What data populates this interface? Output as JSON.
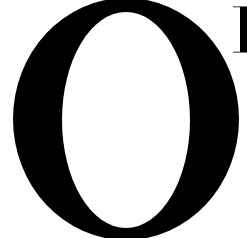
{
  "text": {
    "visible_glyphs": "O",
    "partial_next_glyph": "stem of a serif capital (cropped)"
  },
  "colors": {
    "ink": "#000000",
    "background": "#ffffff"
  },
  "glyph_o": {
    "outer": {
      "cx": 126,
      "cy": 119,
      "rx": 113,
      "ry": 121
    },
    "inner": {
      "cx": 126,
      "cy": 120,
      "rx": 64,
      "ry": 108
    }
  },
  "partial_glyph": {
    "serif_top": {
      "x": 233,
      "y": 6,
      "w": 14,
      "h": 2
    },
    "stem": {
      "x": 240,
      "y": 7,
      "w": 7,
      "h": 45
    },
    "serif_bottom": {
      "x": 233,
      "y": 51,
      "w": 14,
      "h": 2
    }
  }
}
